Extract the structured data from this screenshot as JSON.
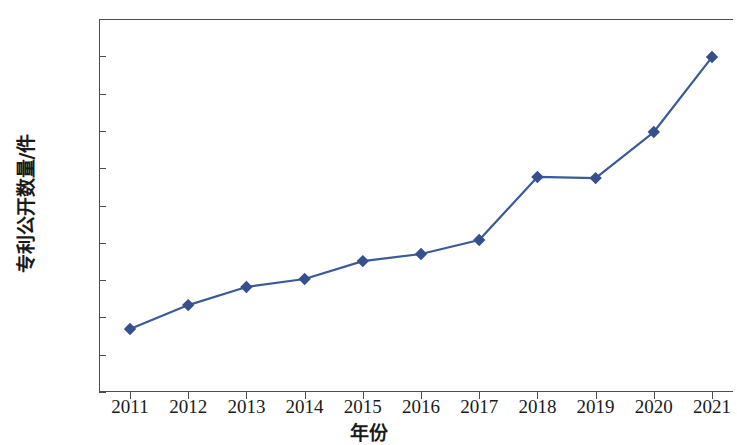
{
  "chart_data": {
    "type": "line",
    "title": "",
    "xlabel": "年份",
    "ylabel": "专利公开数量/件",
    "categories": [
      "2011",
      "2012",
      "2013",
      "2014",
      "2015",
      "2016",
      "2017",
      "2018",
      "2019",
      "2020",
      "2021"
    ],
    "values": [
      33800,
      46600,
      56300,
      60600,
      70200,
      74000,
      81500,
      115300,
      114700,
      139400,
      179600
    ],
    "series": [
      {
        "name": "专利公开数量",
        "values": [
          33800,
          46600,
          56300,
          60600,
          70200,
          74000,
          81500,
          115300,
          114700,
          139400,
          179600
        ]
      }
    ],
    "ylim": [
      0,
      200000
    ],
    "y_ticks": [
      0,
      20000,
      40000,
      60000,
      80000,
      100000,
      120000,
      140000,
      160000,
      180000,
      200000
    ],
    "y_tick_labels": [
      "0",
      "20000",
      "40000",
      "60000",
      "80000",
      "100000",
      "120000",
      "140000",
      "160000",
      "180000",
      "200000"
    ],
    "x_tick_labels": [
      "2011",
      "2012",
      "2013",
      "2014",
      "2015",
      "2016",
      "2017",
      "2018",
      "2019",
      "2020",
      "2021"
    ],
    "grid": false,
    "legend": "none",
    "marker": "diamond",
    "line_color": "#3b5a9a",
    "marker_color": "#36508f",
    "axis_color": "#4d4d4d",
    "background_color": "#ffffff"
  }
}
